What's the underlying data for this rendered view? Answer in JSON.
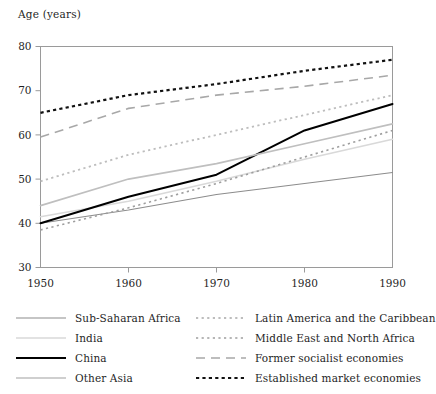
{
  "chart_data": {
    "type": "line",
    "title": "Age (years)",
    "ylabel": "Age (years)",
    "xlabel": "",
    "x": [
      1950,
      1960,
      1970,
      1980,
      1990
    ],
    "xlim": [
      1950,
      1990
    ],
    "ylim": [
      30,
      80
    ],
    "xticks": [
      "1950",
      "1960",
      "1970",
      "1980",
      "1990"
    ],
    "yticks": [
      "30",
      "40",
      "50",
      "60",
      "70",
      "80"
    ],
    "grid": false,
    "legend_position": "below-two-columns",
    "series": [
      {
        "name": "Sub-Saharan Africa",
        "values": [
          40.0,
          43.0,
          46.5,
          49.0,
          51.5
        ],
        "color": "#8c8c8c",
        "style": "solid",
        "width": 1.1
      },
      {
        "name": "India",
        "values": [
          41.5,
          45.0,
          49.5,
          54.5,
          59.0
        ],
        "color": "#d9d9d9",
        "style": "solid",
        "width": 1.6
      },
      {
        "name": "China",
        "values": [
          40.0,
          46.0,
          51.0,
          61.0,
          67.0
        ],
        "color": "#000000",
        "style": "solid",
        "width": 2.0
      },
      {
        "name": "Other Asia",
        "values": [
          44.0,
          50.0,
          53.5,
          58.0,
          62.5
        ],
        "color": "#bfbfbf",
        "style": "solid",
        "width": 1.6
      },
      {
        "name": "Latin America and the Caribbean",
        "values": [
          49.5,
          55.5,
          60.0,
          64.5,
          69.0
        ],
        "color": "#bdbdbd",
        "style": "dotted",
        "width": 1.8
      },
      {
        "name": "Middle East and North Africa",
        "values": [
          38.5,
          43.5,
          49.0,
          55.0,
          61.0
        ],
        "color": "#9e9e9e",
        "style": "dotted",
        "width": 1.6
      },
      {
        "name": "Former socialist economies",
        "values": [
          59.5,
          66.0,
          69.0,
          71.0,
          73.5
        ],
        "color": "#a8a8a8",
        "style": "dashed",
        "width": 1.6
      },
      {
        "name": "Established market economies",
        "values": [
          65.0,
          69.0,
          71.5,
          74.5,
          77.0
        ],
        "color": "#111111",
        "style": "dotted-bold",
        "width": 2.2
      }
    ]
  },
  "legend": {
    "columns": [
      {
        "entries": [
          {
            "label": "Sub-Saharan Africa",
            "series_index": 0
          },
          {
            "label": "India",
            "series_index": 1
          },
          {
            "label": "China",
            "series_index": 2
          },
          {
            "label": "Other Asia",
            "series_index": 3
          }
        ]
      },
      {
        "entries": [
          {
            "label": "Latin America and the Caribbean",
            "series_index": 4
          },
          {
            "label": "Middle East and North Africa",
            "series_index": 5
          },
          {
            "label": "Former socialist economies",
            "series_index": 6
          },
          {
            "label": "Established market economies",
            "series_index": 7
          }
        ]
      }
    ]
  },
  "axes": {
    "frame_color": "#9a9a9a",
    "tick_color": "#9a9a9a",
    "text_color": "#1f1f1f"
  }
}
